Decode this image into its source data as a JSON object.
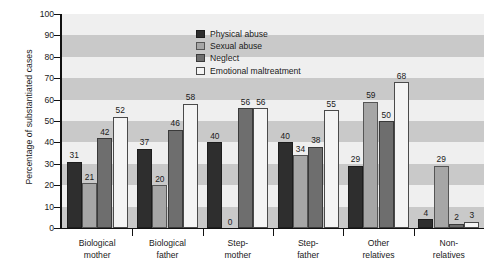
{
  "chart_data": {
    "type": "bar",
    "title": "",
    "subtitle": "",
    "xlabel": "",
    "ylabel": "Percentage of substantiated cases",
    "ylim": [
      0,
      100
    ],
    "ytick_step": 10,
    "yticks": [
      100,
      90,
      80,
      70,
      60,
      50,
      40,
      30,
      20,
      10,
      0
    ],
    "grid": "horizontal alternating shaded bands every 10 units",
    "legend_position": "top-center inside plot",
    "categories": [
      "Biological mother",
      "Biological father",
      "Step-mother",
      "Step-father",
      "Other relatives",
      "Non-relatives"
    ],
    "category_lines": [
      [
        "Biological",
        "mother"
      ],
      [
        "Biological",
        "father"
      ],
      [
        "Step-",
        "mother"
      ],
      [
        "Step-",
        "father"
      ],
      [
        "Other",
        "relatives"
      ],
      [
        "Non-",
        "relatives"
      ]
    ],
    "series": [
      {
        "name": "Physical abuse",
        "color": "#2e2e2e",
        "values": [
          31,
          37,
          40,
          40,
          29,
          4
        ]
      },
      {
        "name": "Sexual abuse",
        "color": "#a6a6a6",
        "values": [
          21,
          20,
          0,
          34,
          59,
          29
        ]
      },
      {
        "name": "Neglect",
        "color": "#6e6e6e",
        "values": [
          42,
          46,
          56,
          38,
          50,
          2
        ]
      },
      {
        "name": "Emotional maltreatment",
        "color": "#f4f4f4",
        "values": [
          52,
          58,
          56,
          55,
          68,
          3
        ]
      }
    ]
  },
  "colors": {
    "band_dark": "#c9c9c9",
    "band_light": "#efefef",
    "axis": "#111111",
    "text": "#1a1a1a",
    "background": "#ffffff"
  }
}
